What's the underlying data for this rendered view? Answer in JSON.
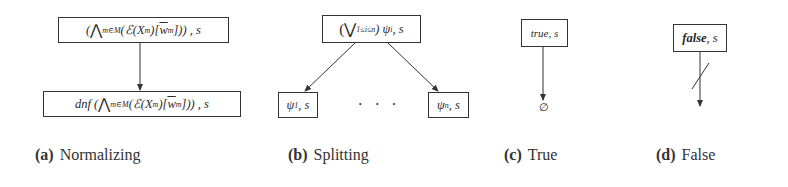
{
  "figure": {
    "subfigures": [
      {
        "id": "a",
        "caption_label": "(a)",
        "caption_text": "Normalizing",
        "nodes": {
          "top": {
            "prefix": "(",
            "bigop": "⋀",
            "sub": "m∈M",
            "body_pre": "(ℰ(X",
            "body_sub": "m",
            "body_mid": ")[",
            "w": "w",
            "w_sub": "m",
            "body_post": "])) , s"
          },
          "bottom": {
            "prefix": "dnf (",
            "bigop": "⋀",
            "sub": "m∈M",
            "body_pre": "(ℰ(X",
            "body_sub": "m",
            "body_mid": ")[",
            "w": "w",
            "w_sub": "m",
            "body_post": "])) , s"
          }
        }
      },
      {
        "id": "b",
        "caption_label": "(b)",
        "caption_text": "Splitting",
        "nodes": {
          "top": {
            "prefix": "(",
            "bigop": "⋁",
            "sub": "1≤i≤n",
            "body": ") ψ",
            "body_sub": "i",
            "suffix": ", s"
          },
          "left": {
            "body": "ψ",
            "body_sub": "1",
            "suffix": ", s"
          },
          "right": {
            "body": "ψ",
            "body_sub": "n",
            "suffix": ", s"
          },
          "ellipsis": "· · ·"
        }
      },
      {
        "id": "c",
        "caption_label": "(c)",
        "caption_text": "True",
        "nodes": {
          "top": {
            "keyword": "true",
            "suffix": ", s"
          },
          "result": "∅"
        }
      },
      {
        "id": "d",
        "caption_label": "(d)",
        "caption_text": "False",
        "nodes": {
          "top": {
            "keyword": "false",
            "suffix": ", s"
          }
        }
      }
    ]
  }
}
